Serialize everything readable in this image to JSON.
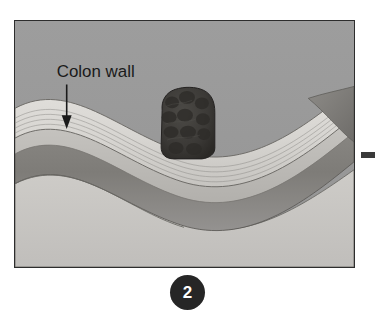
{
  "figure": {
    "panel_number": "2",
    "annotations": [
      {
        "id": "colon-wall",
        "label": "Colon wall",
        "pointer": "down-arrow"
      }
    ],
    "colors": {
      "lumen_background": "#9a9a9a",
      "mucosa_band": "#d8d6d2",
      "submucosa_band": "#bdbbb7",
      "muscularis_band": "#8c8a86",
      "serosa_band": "#c8c6c2",
      "tumor_mass": "#3d3b38",
      "frame_border": "#2d2d2d",
      "badge_background": "#262626",
      "badge_text": "#ffffff",
      "label_text": "#1a1a1a",
      "arrow": "#1a1a1a",
      "edge_dash": "#3a3a3a"
    },
    "anatomy": {
      "structures": [
        "colon lumen",
        "mucosa",
        "submucosa",
        "muscularis propria",
        "serosa",
        "tumor mass"
      ]
    }
  }
}
